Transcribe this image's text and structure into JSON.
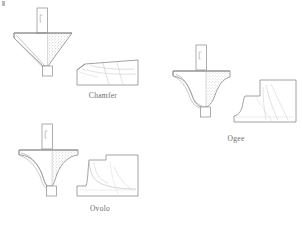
{
  "page": {
    "background_color": "#ffffff",
    "width": 302,
    "height": 225
  },
  "style": {
    "line_color": "#8a8a8a",
    "line_color_dark": "#6f6f6f",
    "stipple_color": "#b0b0b0",
    "shading_color": "#cfcfcf",
    "caption_color": "#6a6a6a"
  },
  "figures": [
    {
      "id": "chamfer",
      "caption": "Chamfer",
      "cutter_label": "chamfer-cutter-cross-section",
      "profile_label": "chamfer-profile-block",
      "description": "V-shaped bevel cutter with vertical shank and stippled cut region"
    },
    {
      "id": "ogee",
      "caption": "Ogee",
      "cutter_label": "ogee-cutter-cross-section",
      "profile_label": "ogee-profile-block",
      "description": "S-curve cutter with vertical shank and stippled cut region"
    },
    {
      "id": "ovolo",
      "caption": "Ovolo",
      "cutter_label": "ovolo-cutter-cross-section",
      "profile_label": "ovolo-profile-block",
      "description": "Quarter-round convex cutter with vertical shank and stippled cut region"
    }
  ]
}
